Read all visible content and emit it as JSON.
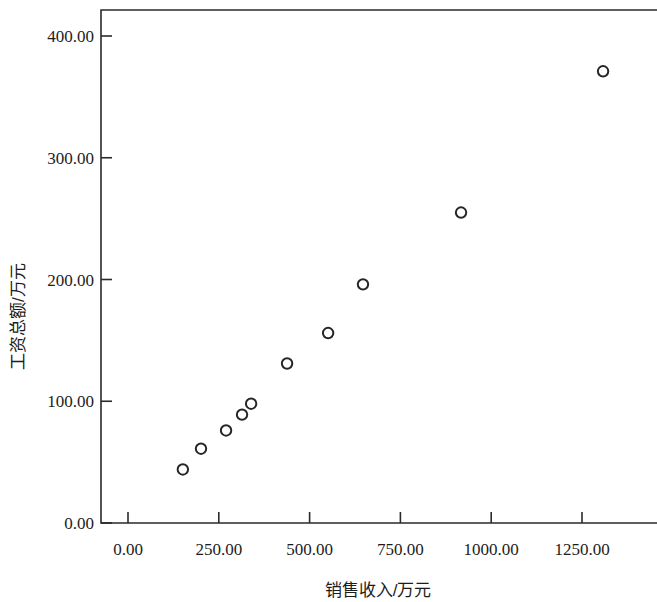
{
  "chart_data": {
    "type": "scatter",
    "title": "",
    "xlabel": "销售收入/万元",
    "ylabel": "工资总额/万元",
    "xlim": [
      0,
      1400
    ],
    "ylim": [
      0,
      430
    ],
    "grid": false,
    "legend": "none",
    "xticks": [
      0,
      250,
      500,
      750,
      1000,
      1250
    ],
    "yticks": [
      0,
      100,
      200,
      300,
      400
    ],
    "xtick_labels": [
      "0.00",
      "250.00",
      "500.00",
      "750.00",
      "1000.00",
      "1250.00"
    ],
    "ytick_labels": [
      "0.00",
      "100.00",
      "200.00",
      "300.00",
      "400.00"
    ],
    "marker": "open-circle",
    "marker_color": "#262626",
    "series": [
      {
        "name": "工资总额",
        "points": [
          {
            "x": 151,
            "y": 44
          },
          {
            "x": 201,
            "y": 61
          },
          {
            "x": 270,
            "y": 76
          },
          {
            "x": 314,
            "y": 89
          },
          {
            "x": 339,
            "y": 98
          },
          {
            "x": 438,
            "y": 131
          },
          {
            "x": 551,
            "y": 156
          },
          {
            "x": 647,
            "y": 196
          },
          {
            "x": 917,
            "y": 255
          },
          {
            "x": 1308,
            "y": 371
          }
        ]
      }
    ]
  },
  "axes": {
    "y_title": "工资总额/万元",
    "x_title": "销售收入/万元"
  }
}
